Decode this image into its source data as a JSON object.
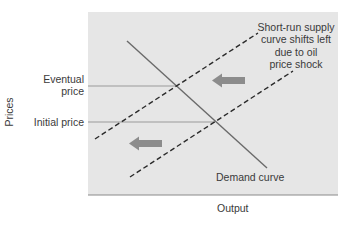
{
  "diagram": {
    "axis_labels": {
      "x": "Output",
      "y": "Prices"
    },
    "price_labels": {
      "eventual_line1": "Eventual",
      "eventual_line2": "price",
      "initial": "Initial price"
    },
    "annotation": {
      "line1": "Short-run supply",
      "line2": "curve shifts left",
      "line3": "due to oil",
      "line4": "price shock"
    },
    "demand_label": "Demand curve",
    "colors": {
      "plot_bg": "#e6e6e6",
      "axis": "#8a8a8a",
      "demand": "#6a6a6a",
      "supply_dashed": "#2a2a2a",
      "price_lines": "#9a9a9a",
      "arrows": "#8c8c8c"
    }
  }
}
